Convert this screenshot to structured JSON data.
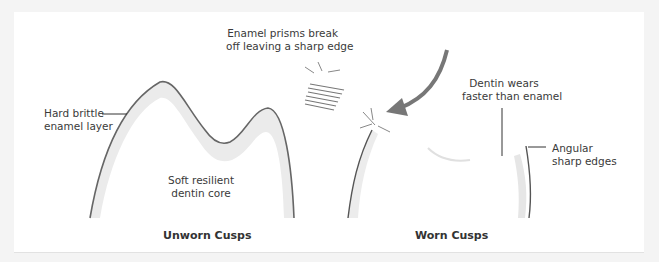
{
  "diagram": {
    "panels": [
      {
        "caption": "Unworn Cusps"
      },
      {
        "caption": "Worn Cusps"
      }
    ],
    "labels": {
      "enamel_layer": "Hard brittle\nenamel layer",
      "dentin_core": "Soft resilient\ndentin core",
      "prisms_break": "Enamel prisms break\noff leaving a sharp edge",
      "dentin_wears": "Dentin wears\nfaster than enamel",
      "angular_edges": "Angular\nsharp edges"
    },
    "colors": {
      "outline": "#666666",
      "enamel_fill": "#ebebeb",
      "arrow": "#777777",
      "background": "#ffffff"
    }
  }
}
